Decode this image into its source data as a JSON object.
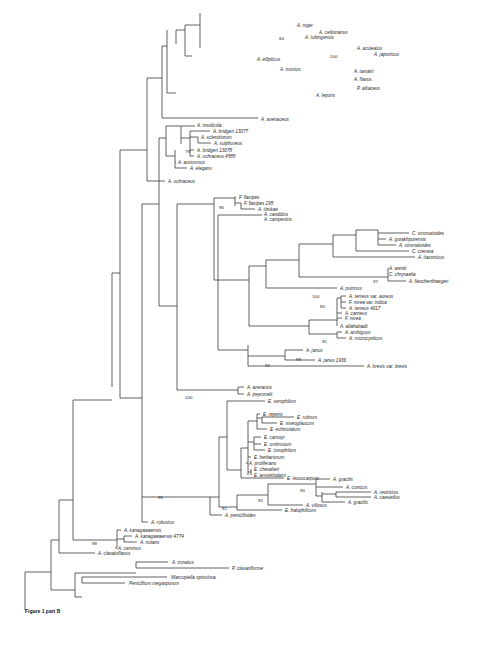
{
  "figure": {
    "caption": "Figure 1 part B",
    "type": "phylogenetic-tree"
  },
  "taxa": [
    {
      "label": "A. niger",
      "x": 297,
      "y": 25
    },
    {
      "label": "A. ceilionanus",
      "x": 319,
      "y": 32
    },
    {
      "label": "A. tubingensis",
      "x": 305,
      "y": 37
    },
    {
      "label": "A. aculeatus",
      "x": 357,
      "y": 48
    },
    {
      "label": "A. japonicus",
      "x": 374,
      "y": 54
    },
    {
      "label": "A. ellipticus",
      "x": 257,
      "y": 59
    },
    {
      "label": "A. nomius",
      "x": 280,
      "y": 69
    },
    {
      "label": "A. tamarii",
      "x": 354,
      "y": 71
    },
    {
      "label": "A. flavus",
      "x": 354,
      "y": 79
    },
    {
      "label": "P. alliaceus",
      "x": 357,
      "y": 88
    },
    {
      "label": "A. leporis",
      "x": 316,
      "y": 95
    },
    {
      "label": "A. avenaceus",
      "x": 261,
      "y": 119
    },
    {
      "label": "A. insulicola",
      "x": 197,
      "y": 125
    },
    {
      "label": "A. bridgeri 13077",
      "x": 213,
      "y": 131
    },
    {
      "label": "A. sclerotiorum",
      "x": 201,
      "y": 137
    },
    {
      "label": "A. sulphureus",
      "x": 214,
      "y": 143
    },
    {
      "label": "A. bridgeri 13078",
      "x": 197,
      "y": 150
    },
    {
      "label": "A. ochraceus 4585",
      "x": 197,
      "y": 156
    },
    {
      "label": "A. auricomus",
      "x": 178,
      "y": 162
    },
    {
      "label": "A. elegans",
      "x": 190,
      "y": 168
    },
    {
      "label": "A. ochraceus",
      "x": 168,
      "y": 181
    },
    {
      "label": "F. flavipes",
      "x": 239,
      "y": 197
    },
    {
      "label": "F. flavipes 295",
      "x": 244,
      "y": 203
    },
    {
      "label": "A. iizukae",
      "x": 258,
      "y": 209
    },
    {
      "label": "A. candidus",
      "x": 264,
      "y": 214
    },
    {
      "label": "A. campestris",
      "x": 264,
      "y": 219
    },
    {
      "label": "C. stromatoides",
      "x": 412,
      "y": 233
    },
    {
      "label": "A. gorakhpurensis",
      "x": 389,
      "y": 239
    },
    {
      "label": "A. stromatoides",
      "x": 399,
      "y": 245
    },
    {
      "label": "C. cremea",
      "x": 412,
      "y": 251
    },
    {
      "label": "A. itaconicus",
      "x": 418,
      "y": 257
    },
    {
      "label": "A. wentii",
      "x": 389,
      "y": 268
    },
    {
      "label": "C. chrysaelia",
      "x": 389,
      "y": 274
    },
    {
      "label": "A. fieschenthaegeri",
      "x": 409,
      "y": 281
    },
    {
      "label": "A. puinnus",
      "x": 340,
      "y": 288
    },
    {
      "label": "A. terreus var. aureus",
      "x": 349,
      "y": 296
    },
    {
      "label": "F. nivea var. indica",
      "x": 349,
      "y": 302
    },
    {
      "label": "A. terreus 4017",
      "x": 349,
      "y": 308
    },
    {
      "label": "A. carneus",
      "x": 345,
      "y": 313
    },
    {
      "label": "F. nivea",
      "x": 345,
      "y": 318
    },
    {
      "label": "A. allahabadii",
      "x": 340,
      "y": 326
    },
    {
      "label": "A. ambiguus",
      "x": 345,
      "y": 332
    },
    {
      "label": "A. microcysticus",
      "x": 349,
      "y": 338
    },
    {
      "label": "A. janus",
      "x": 306,
      "y": 350
    },
    {
      "label": "A. janus 1936",
      "x": 318,
      "y": 360
    },
    {
      "label": "A. brevis var. brevis",
      "x": 367,
      "y": 366
    },
    {
      "label": "A. arenarius",
      "x": 247,
      "y": 387
    },
    {
      "label": "A. peyronelii",
      "x": 247,
      "y": 394
    },
    {
      "label": "E. xerophilum",
      "x": 268,
      "y": 401
    },
    {
      "label": "E. repens",
      "x": 263,
      "y": 414
    },
    {
      "label": "E. rubrum",
      "x": 297,
      "y": 417
    },
    {
      "label": "E. niveoglaucum",
      "x": 280,
      "y": 423
    },
    {
      "label": "E. echinulatum",
      "x": 270,
      "y": 429
    },
    {
      "label": "E. carnoyi",
      "x": 264,
      "y": 437
    },
    {
      "label": "E. umbrosum",
      "x": 264,
      "y": 444
    },
    {
      "label": "E. tonophilum",
      "x": 268,
      "y": 450
    },
    {
      "label": "E. herbariorum",
      "x": 254,
      "y": 457
    },
    {
      "label": "A. proliferans",
      "x": 249,
      "y": 463
    },
    {
      "label": "E. chevalieri",
      "x": 254,
      "y": 469
    },
    {
      "label": "E. amstelodami",
      "x": 254,
      "y": 475
    },
    {
      "label": "E. leucocarpum",
      "x": 287,
      "y": 478
    },
    {
      "label": "A. gracilis",
      "x": 333,
      "y": 479
    },
    {
      "label": "A. conicus",
      "x": 346,
      "y": 487
    },
    {
      "label": "A. restrictus",
      "x": 374,
      "y": 492
    },
    {
      "label": "A. caesiellus",
      "x": 374,
      "y": 497
    },
    {
      "label": "A. gracilis",
      "x": 348,
      "y": 502
    },
    {
      "label": "A. villosus",
      "x": 306,
      "y": 505
    },
    {
      "label": "E. halophilicum",
      "x": 285,
      "y": 510
    },
    {
      "label": "A. penicilloides",
      "x": 225,
      "y": 515
    },
    {
      "label": "A. robustus",
      "x": 151,
      "y": 522
    },
    {
      "label": "A. kanagawaensis",
      "x": 124,
      "y": 530
    },
    {
      "label": "A. kanagawaensis 4774",
      "x": 135,
      "y": 536
    },
    {
      "label": "A. nutans",
      "x": 140,
      "y": 542
    },
    {
      "label": "A. cervinus",
      "x": 118,
      "y": 548
    },
    {
      "label": "A. clavatoflavus",
      "x": 98,
      "y": 553
    },
    {
      "label": "A. zonatus",
      "x": 172,
      "y": 562
    },
    {
      "label": "P. clavariiforme",
      "x": 232,
      "y": 568
    },
    {
      "label": "Warcupiella spinulosa",
      "x": 171,
      "y": 577
    },
    {
      "label": "Penicillium megasporum",
      "x": 129,
      "y": 583
    }
  ],
  "bootstrap_values": [
    {
      "value": "84",
      "x": 279,
      "y": 38
    },
    {
      "value": "100",
      "x": 330,
      "y": 56
    },
    {
      "value": "79",
      "x": 185,
      "y": 151
    },
    {
      "value": "96",
      "x": 219,
      "y": 207
    },
    {
      "value": "97",
      "x": 373,
      "y": 281
    },
    {
      "value": "100",
      "x": 312,
      "y": 296
    },
    {
      "value": "80",
      "x": 320,
      "y": 306
    },
    {
      "value": "91",
      "x": 322,
      "y": 341
    },
    {
      "value": "99",
      "x": 296,
      "y": 359
    },
    {
      "value": "92",
      "x": 265,
      "y": 365
    },
    {
      "value": "100",
      "x": 185,
      "y": 397
    },
    {
      "value": "90",
      "x": 300,
      "y": 490
    },
    {
      "value": "92",
      "x": 258,
      "y": 500
    },
    {
      "value": "95",
      "x": 158,
      "y": 497
    },
    {
      "value": "81",
      "x": 222,
      "y": 508
    },
    {
      "value": "98",
      "x": 92,
      "y": 543
    }
  ],
  "branches": [
    [
      25,
      610,
      25,
      591
    ],
    [
      25,
      591,
      25,
      572
    ],
    [
      25,
      572,
      51,
      572
    ],
    [
      51,
      540,
      51,
      590
    ],
    [
      51,
      590,
      75,
      590
    ],
    [
      75,
      573,
      75,
      597
    ],
    [
      75,
      573,
      136,
      573
    ],
    [
      136,
      562,
      136,
      568
    ],
    [
      136,
      562,
      168,
      562
    ],
    [
      136,
      568,
      229,
      568
    ],
    [
      75,
      597,
      82,
      597
    ],
    [
      82,
      577,
      82,
      583
    ],
    [
      82,
      577,
      167,
      577
    ],
    [
      82,
      583,
      125,
      583
    ],
    [
      51,
      540,
      59,
      540
    ],
    [
      59,
      500,
      59,
      553
    ],
    [
      59,
      553,
      95,
      553
    ],
    [
      59,
      500,
      73,
      500
    ],
    [
      73,
      400,
      73,
      540
    ],
    [
      73,
      540,
      117,
      540
    ],
    [
      117,
      530,
      117,
      548
    ],
    [
      117,
      530,
      121,
      530
    ],
    [
      117,
      548,
      115,
      548
    ],
    [
      124,
      536,
      124,
      542
    ],
    [
      117,
      539,
      124,
      539
    ],
    [
      124,
      536,
      132,
      536
    ],
    [
      124,
      542,
      137,
      542
    ],
    [
      73,
      400,
      112,
      400
    ],
    [
      112,
      273,
      112,
      387
    ],
    [
      112,
      273,
      120,
      273
    ],
    [
      120,
      150,
      120,
      398
    ],
    [
      120,
      150,
      147,
      150
    ],
    [
      147,
      78,
      147,
      181
    ],
    [
      147,
      181,
      165,
      181
    ],
    [
      147,
      78,
      162,
      78
    ],
    [
      162,
      46,
      162,
      118
    ],
    [
      162,
      118,
      258,
      118
    ],
    [
      162,
      46,
      167,
      46
    ],
    [
      167,
      30,
      167,
      93
    ],
    [
      167,
      93,
      176,
      93
    ],
    [
      176,
      30,
      176,
      44
    ],
    [
      176,
      30,
      185,
      30
    ],
    [
      185,
      25,
      185,
      56
    ],
    [
      185,
      56,
      192,
      56
    ],
    [
      185,
      25,
      200,
      25
    ],
    [
      200,
      13,
      200,
      48
    ],
    [
      120,
      398,
      142,
      398
    ],
    [
      142,
      204,
      142,
      398
    ],
    [
      142,
      204,
      159,
      204
    ],
    [
      159,
      138,
      159,
      306
    ],
    [
      159,
      138,
      166,
      138
    ],
    [
      166,
      126,
      166,
      156
    ],
    [
      166,
      126,
      181,
      126
    ],
    [
      166,
      156,
      175,
      156
    ],
    [
      175,
      150,
      175,
      168
    ],
    [
      175,
      162,
      176,
      162
    ],
    [
      175,
      168,
      187,
      168
    ],
    [
      181,
      126,
      181,
      144
    ],
    [
      181,
      126,
      195,
      126
    ],
    [
      181,
      138,
      190,
      138
    ],
    [
      190,
      131,
      190,
      156
    ],
    [
      190,
      131,
      210,
      131
    ],
    [
      190,
      137,
      198,
      137
    ],
    [
      190,
      150,
      194,
      150
    ],
    [
      190,
      156,
      194,
      156
    ],
    [
      198,
      137,
      198,
      143
    ],
    [
      198,
      143,
      211,
      143
    ],
    [
      159,
      306,
      177,
      306
    ],
    [
      177,
      204,
      177,
      390
    ],
    [
      177,
      390,
      238,
      390
    ],
    [
      238,
      387,
      238,
      394
    ],
    [
      238,
      387,
      244,
      387
    ],
    [
      238,
      394,
      244,
      394
    ],
    [
      177,
      204,
      214,
      204
    ],
    [
      214,
      198,
      214,
      280
    ],
    [
      214,
      198,
      235,
      198
    ],
    [
      235,
      197,
      235,
      206
    ],
    [
      235,
      197,
      236,
      197
    ],
    [
      235,
      203,
      241,
      203
    ],
    [
      241,
      203,
      241,
      209
    ],
    [
      241,
      209,
      255,
      209
    ],
    [
      214,
      280,
      218,
      280
    ],
    [
      218,
      215,
      218,
      350
    ],
    [
      218,
      215,
      262,
      215
    ],
    [
      218,
      350,
      248,
      350
    ],
    [
      248,
      345,
      248,
      366
    ],
    [
      248,
      366,
      364,
      366
    ],
    [
      248,
      356,
      285,
      356
    ],
    [
      285,
      350,
      285,
      360
    ],
    [
      285,
      350,
      303,
      350
    ],
    [
      285,
      360,
      315,
      360
    ],
    [
      218,
      280,
      249,
      280
    ],
    [
      249,
      266,
      249,
      326
    ],
    [
      249,
      266,
      266,
      266
    ],
    [
      266,
      260,
      266,
      288
    ],
    [
      266,
      288,
      337,
      288
    ],
    [
      266,
      260,
      299,
      260
    ],
    [
      299,
      244,
      299,
      277
    ],
    [
      299,
      244,
      333,
      244
    ],
    [
      333,
      235,
      333,
      257
    ],
    [
      333,
      257,
      415,
      257
    ],
    [
      333,
      235,
      356,
      235
    ],
    [
      356,
      230,
      356,
      251
    ],
    [
      356,
      251,
      409,
      251
    ],
    [
      356,
      230,
      378,
      230
    ],
    [
      378,
      230,
      378,
      245
    ],
    [
      378,
      245,
      396,
      245
    ],
    [
      378,
      233,
      409,
      233
    ],
    [
      378,
      239,
      386,
      239
    ],
    [
      299,
      277,
      388,
      277
    ],
    [
      388,
      268,
      388,
      281
    ],
    [
      388,
      268,
      388,
      268
    ],
    [
      388,
      274,
      388,
      274
    ],
    [
      388,
      281,
      406,
      281
    ],
    [
      249,
      326,
      309,
      326
    ],
    [
      309,
      320,
      309,
      334
    ],
    [
      309,
      334,
      337,
      334
    ],
    [
      337,
      332,
      337,
      338
    ],
    [
      337,
      332,
      342,
      332
    ],
    [
      337,
      338,
      346,
      338
    ],
    [
      309,
      320,
      337,
      320
    ],
    [
      337,
      298,
      337,
      326
    ],
    [
      337,
      326,
      337,
      326
    ],
    [
      337,
      298,
      341,
      298
    ],
    [
      341,
      296,
      341,
      308
    ],
    [
      341,
      296,
      346,
      296
    ],
    [
      341,
      302,
      346,
      302
    ],
    [
      341,
      308,
      346,
      308
    ],
    [
      337,
      313,
      342,
      313
    ],
    [
      337,
      318,
      342,
      318
    ],
    [
      142,
      398,
      142,
      497
    ],
    [
      142,
      497,
      210,
      497
    ],
    [
      210,
      497,
      210,
      515
    ],
    [
      210,
      515,
      222,
      515
    ],
    [
      210,
      497,
      219,
      497
    ],
    [
      219,
      437,
      219,
      507
    ],
    [
      219,
      437,
      227,
      437
    ],
    [
      227,
      401,
      227,
      470
    ],
    [
      227,
      401,
      265,
      401
    ],
    [
      227,
      470,
      241,
      470
    ],
    [
      241,
      448,
      241,
      478
    ],
    [
      241,
      478,
      284,
      478
    ],
    [
      241,
      448,
      248,
      448
    ],
    [
      248,
      421,
      248,
      475
    ],
    [
      248,
      421,
      257,
      421
    ],
    [
      257,
      414,
      257,
      429
    ],
    [
      257,
      414,
      260,
      414
    ],
    [
      257,
      429,
      267,
      429
    ],
    [
      262,
      417,
      262,
      423
    ],
    [
      257,
      418,
      262,
      418
    ],
    [
      262,
      417,
      294,
      417
    ],
    [
      262,
      423,
      277,
      423
    ],
    [
      248,
      442,
      254,
      442
    ],
    [
      254,
      437,
      254,
      450
    ],
    [
      254,
      437,
      261,
      437
    ],
    [
      254,
      444,
      261,
      444
    ],
    [
      254,
      450,
      265,
      450
    ],
    [
      248,
      457,
      251,
      457
    ],
    [
      248,
      463,
      246,
      463
    ],
    [
      248,
      472,
      251,
      472
    ],
    [
      251,
      469,
      251,
      475
    ],
    [
      219,
      507,
      237,
      507
    ],
    [
      237,
      495,
      237,
      510
    ],
    [
      237,
      510,
      282,
      510
    ],
    [
      237,
      495,
      268,
      495
    ],
    [
      268,
      484,
      268,
      505
    ],
    [
      268,
      505,
      303,
      505
    ],
    [
      268,
      484,
      316,
      484
    ],
    [
      316,
      479,
      316,
      496
    ],
    [
      316,
      479,
      330,
      479
    ],
    [
      316,
      487,
      343,
      487
    ],
    [
      316,
      496,
      322,
      496
    ],
    [
      322,
      492,
      322,
      502
    ],
    [
      322,
      502,
      345,
      502
    ],
    [
      322,
      494,
      336,
      494
    ],
    [
      336,
      492,
      336,
      497
    ],
    [
      336,
      492,
      371,
      492
    ],
    [
      336,
      497,
      371,
      497
    ],
    [
      142,
      497,
      142,
      522
    ],
    [
      142,
      522,
      148,
      522
    ]
  ]
}
